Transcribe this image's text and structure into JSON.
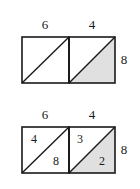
{
  "figures": [
    {
      "id": "top-figure",
      "name": "rectangle-divided-two-squares-plain",
      "top_labels": [
        "6",
        "4"
      ],
      "right_label": "8",
      "cells": [
        {
          "name": "left-square",
          "top_label": "6",
          "shaded": "none",
          "diagonal": "bottom-left-to-top-right",
          "inner_labels": []
        },
        {
          "name": "right-square",
          "top_label": "4",
          "shaded": "lower-right-triangle",
          "diagonal": "bottom-left-to-top-right",
          "inner_labels": []
        }
      ]
    },
    {
      "id": "bottom-figure",
      "name": "rectangle-divided-two-squares-labeled",
      "top_labels": [
        "6",
        "4"
      ],
      "right_label": "8",
      "cells": [
        {
          "name": "left-square",
          "top_label": "6",
          "shaded": "none",
          "diagonal": "bottom-left-to-top-right",
          "inner_labels": [
            {
              "position": "upper-left",
              "value": "4"
            },
            {
              "position": "lower-right",
              "value": "8"
            }
          ]
        },
        {
          "name": "right-square",
          "top_label": "4",
          "shaded": "lower-right-triangle",
          "diagonal": "bottom-left-to-top-right",
          "inner_labels": [
            {
              "position": "upper-left",
              "value": "3"
            },
            {
              "position": "lower-right",
              "value": "2"
            }
          ]
        }
      ]
    }
  ],
  "colors": {
    "stroke": "#1a1a1a",
    "shade_fill": "#e0e0e0",
    "plain_fill": "#ffffff",
    "background": "#ffffff"
  }
}
